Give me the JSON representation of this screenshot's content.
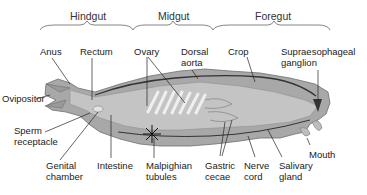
{
  "regions": [
    {
      "label": "Hindgut"
    },
    {
      "label": "Midgut"
    },
    {
      "label": "Foregut"
    }
  ],
  "labels": {
    "anus": "Anus",
    "rectum": "Rectum",
    "ovary": "Ovary",
    "dorsal_aorta_1": "Dorsal",
    "dorsal_aorta_2": "aorta",
    "crop": "Crop",
    "supraesophageal_1": "Supraesophageal",
    "supraesophageal_2": "ganglion",
    "ovipositor": "Ovipositor",
    "sperm_1": "Sperm",
    "sperm_2": "receptacle",
    "genital_1": "Genital",
    "genital_2": "chamber",
    "intestine": "Intestine",
    "malpighian_1": "Malpighian",
    "malpighian_2": "tubules",
    "gastric_1": "Gastric",
    "gastric_2": "cecae",
    "nerve_1": "Nerve",
    "nerve_2": "cord",
    "salivary_1": "Salivary",
    "salivary_2": "gland",
    "mouth": "Mouth"
  },
  "colors": {
    "body_fill": "#a9a9a9",
    "body_dark": "#7d7d7d",
    "body_light": "#cfcfcf",
    "line": "#222222"
  }
}
